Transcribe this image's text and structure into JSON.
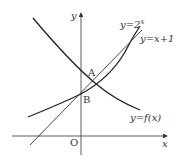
{
  "figure": {
    "axes": {
      "x_label": "x",
      "y_label": "y",
      "origin_label": "O"
    },
    "points": [
      {
        "label": "A",
        "description": "intersection of y=f(x) and y=2^x"
      },
      {
        "label": "B",
        "description": "y-intercept (0,1)"
      }
    ],
    "curves": [
      {
        "name": "exp",
        "label": "y=2",
        "superscript": "x"
      },
      {
        "name": "line",
        "label": "y=x+1"
      },
      {
        "name": "f",
        "label": "y=f(x)"
      }
    ],
    "colors": {
      "stroke": "#333333",
      "background": "#ffffff"
    }
  }
}
